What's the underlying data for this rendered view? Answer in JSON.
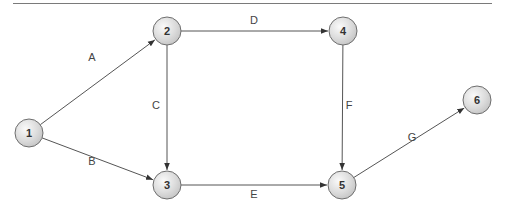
{
  "diagram": {
    "type": "network-activity-on-arrow",
    "colors": {
      "edge": "#555555",
      "node_border": "#6e6e6e",
      "node_fill_light": "#fafafa",
      "node_fill_dark": "#c4c4c4",
      "node_text": "#333333",
      "edge_text": "#444444",
      "top_rule": "#7a7a7a"
    },
    "nodes": [
      {
        "id": "1",
        "label": "1",
        "x": 29,
        "y": 133
      },
      {
        "id": "2",
        "label": "2",
        "x": 167,
        "y": 31
      },
      {
        "id": "3",
        "label": "3",
        "x": 167,
        "y": 185
      },
      {
        "id": "4",
        "label": "4",
        "x": 343,
        "y": 31
      },
      {
        "id": "5",
        "label": "5",
        "x": 342,
        "y": 185
      },
      {
        "id": "6",
        "label": "6",
        "x": 477,
        "y": 100
      }
    ],
    "edges": [
      {
        "label": "A",
        "from": "1",
        "to": "2",
        "label_x": 92,
        "label_y": 61
      },
      {
        "label": "B",
        "from": "1",
        "to": "3",
        "label_x": 92,
        "label_y": 165
      },
      {
        "label": "C",
        "from": "2",
        "to": "3",
        "label_x": 156,
        "label_y": 109
      },
      {
        "label": "D",
        "from": "2",
        "to": "4",
        "label_x": 254,
        "label_y": 24
      },
      {
        "label": "E",
        "from": "3",
        "to": "5",
        "label_x": 254,
        "label_y": 198
      },
      {
        "label": "F",
        "from": "4",
        "to": "5",
        "label_x": 349,
        "label_y": 109
      },
      {
        "label": "G",
        "from": "5",
        "to": "6",
        "label_x": 412,
        "label_y": 141
      }
    ]
  }
}
